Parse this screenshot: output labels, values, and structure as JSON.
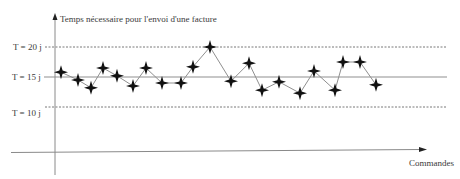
{
  "chart_data": {
    "type": "line",
    "title": "Temps nécessaire pour l'envoi d'une facture",
    "ylabel": "Temps nécessaire pour l'envoi d'une facture",
    "xlabel": "Commandes",
    "grid": false,
    "legend": null,
    "unit": "jours",
    "reference_lines": [
      {
        "label": "T = 20 j",
        "value": 20,
        "style": "dashed",
        "role": "upper-limit"
      },
      {
        "label": "T = 15 j",
        "value": 15,
        "style": "solid",
        "role": "target"
      },
      {
        "label": "T = 10 j",
        "value": 10,
        "style": "dashed",
        "role": "lower-limit"
      }
    ],
    "x": [
      1,
      2,
      3,
      4,
      5,
      6,
      7,
      8,
      9,
      10,
      11,
      12,
      13,
      14,
      15,
      16,
      17,
      18,
      19,
      20,
      21
    ],
    "series": [
      {
        "name": "Temps d'envoi",
        "marker": "four-point-star",
        "values": [
          15.8,
          14.5,
          13.2,
          16.5,
          15.2,
          13.5,
          16.5,
          14.0,
          14.0,
          16.7,
          20.0,
          14.3,
          17.3,
          12.8,
          14.2,
          12.3,
          16.0,
          12.8,
          17.5,
          17.5,
          13.7
        ]
      }
    ],
    "x_positions_px": [
      61,
      78,
      91,
      103,
      117,
      133,
      146,
      162,
      181,
      193,
      210,
      231,
      249,
      262,
      279,
      300,
      314,
      335,
      343,
      360,
      376
    ]
  },
  "labels": {
    "y_axis_title": "Temps nécessaire pour l'envoi d'une facture",
    "x_axis_title": "Commandes",
    "ref_20": "T = 20 j",
    "ref_15": "T = 15 j",
    "ref_10": "T = 10 j"
  },
  "colors": {
    "axis": "#8a8a8a",
    "line": "#8f8f8f",
    "marker": "#111111",
    "text": "#3a3a3a",
    "dashed": "#555555"
  }
}
